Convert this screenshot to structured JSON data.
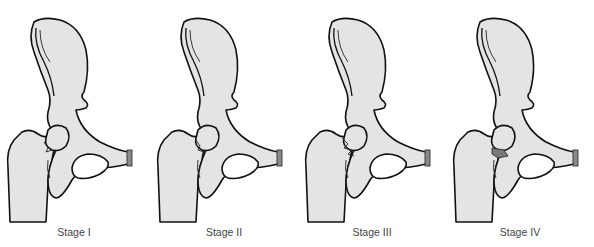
{
  "figure": {
    "panels": [
      {
        "id": "stage-1",
        "label": "Stage I"
      },
      {
        "id": "stage-2",
        "label": "Stage II"
      },
      {
        "id": "stage-3",
        "label": "Stage III"
      },
      {
        "id": "stage-4",
        "label": "Stage IV"
      }
    ],
    "colors": {
      "bone_fill": "#e4e4e4",
      "outline": "#111111",
      "pubic_symphysis": "#8a8a8a",
      "background": "#ffffff",
      "label_text": "#444444"
    }
  }
}
